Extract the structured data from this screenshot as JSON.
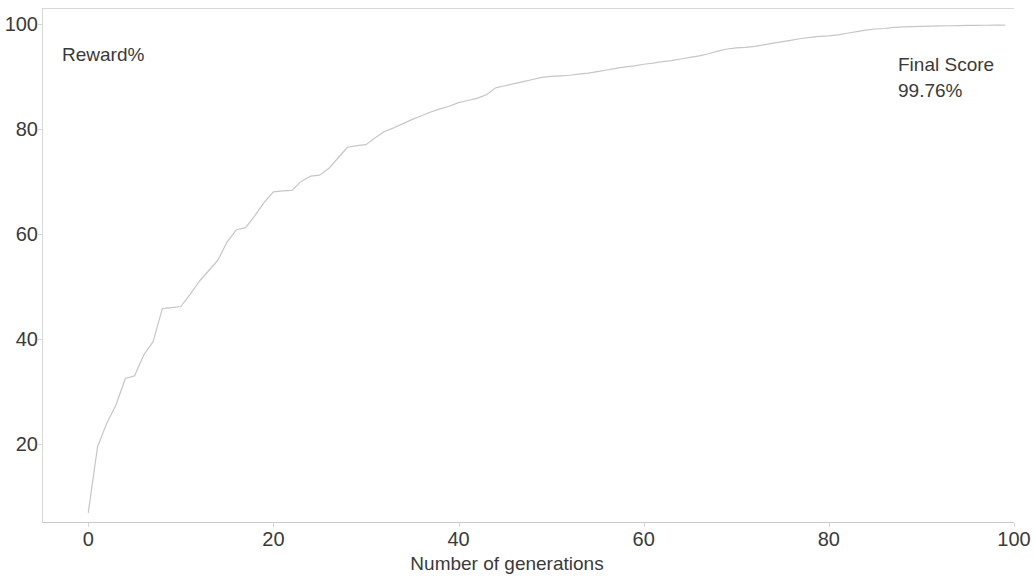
{
  "chart_data": {
    "type": "line",
    "title": "",
    "subtitle": "",
    "xlabel": "Number of generations",
    "ylabel": "Reward%",
    "ylabel_position": "inside-top-left",
    "xlim": [
      -5,
      100
    ],
    "ylim": [
      5,
      103
    ],
    "xticks": [
      0,
      20,
      40,
      60,
      80,
      100
    ],
    "yticks": [
      20,
      40,
      60,
      80,
      100
    ],
    "xtick_labels": [
      "0",
      "20",
      "40",
      "60",
      "80",
      "100"
    ],
    "ytick_labels": [
      "20",
      "40",
      "60",
      "80",
      "100"
    ],
    "grid": false,
    "legend": false,
    "legend_position": "none",
    "line_color": "#c6c6c6",
    "text_color": "#3a3a3a",
    "frame_color": "#d9d9d9",
    "annotations": [
      {
        "name": "final-score",
        "lines": [
          "Final Score",
          "99.76%"
        ],
        "x": 95,
        "y": 95
      }
    ],
    "series": [
      {
        "name": "Reward%",
        "x": [
          0,
          1,
          2,
          3,
          4,
          5,
          6,
          7,
          8,
          9,
          10,
          11,
          12,
          13,
          14,
          15,
          16,
          17,
          18,
          19,
          20,
          21,
          22,
          23,
          24,
          25,
          26,
          27,
          28,
          29,
          30,
          31,
          32,
          33,
          34,
          35,
          36,
          37,
          38,
          39,
          40,
          41,
          42,
          43,
          44,
          45,
          46,
          47,
          48,
          49,
          50,
          51,
          52,
          53,
          54,
          55,
          56,
          57,
          58,
          59,
          60,
          61,
          62,
          63,
          64,
          65,
          66,
          67,
          68,
          69,
          70,
          71,
          72,
          73,
          74,
          75,
          76,
          77,
          78,
          79,
          80,
          81,
          82,
          83,
          84,
          85,
          86,
          87,
          88,
          89,
          90,
          91,
          92,
          93,
          94,
          95,
          96,
          97,
          98,
          99
        ],
        "values": [
          7.0,
          19.5,
          24.0,
          27.5,
          32.5,
          33.0,
          37.0,
          39.5,
          45.8,
          46.0,
          46.2,
          48.5,
          51.0,
          53.0,
          55.0,
          58.5,
          60.8,
          61.2,
          63.5,
          66.0,
          68.0,
          68.2,
          68.3,
          70.0,
          71.0,
          71.2,
          72.5,
          74.5,
          76.5,
          76.8,
          77.0,
          78.3,
          79.5,
          80.2,
          81.0,
          81.8,
          82.5,
          83.2,
          83.8,
          84.3,
          85.0,
          85.4,
          85.8,
          86.5,
          87.8,
          88.2,
          88.6,
          89.0,
          89.4,
          89.8,
          90.0,
          90.1,
          90.2,
          90.4,
          90.6,
          90.9,
          91.2,
          91.5,
          91.8,
          92.0,
          92.3,
          92.5,
          92.8,
          93.0,
          93.3,
          93.6,
          93.9,
          94.3,
          94.8,
          95.2,
          95.4,
          95.5,
          95.7,
          96.0,
          96.3,
          96.6,
          96.9,
          97.2,
          97.4,
          97.6,
          97.7,
          97.9,
          98.2,
          98.5,
          98.8,
          99.0,
          99.1,
          99.3,
          99.4,
          99.45,
          99.5,
          99.55,
          99.6,
          99.62,
          99.65,
          99.68,
          99.7,
          99.72,
          99.74,
          99.76
        ]
      }
    ]
  },
  "axes": {
    "ylabel_text": "Reward%",
    "xlabel_text": "Number of generations"
  },
  "annotation": {
    "final_score_title": "Final Score",
    "final_score_value": "99.76%"
  }
}
